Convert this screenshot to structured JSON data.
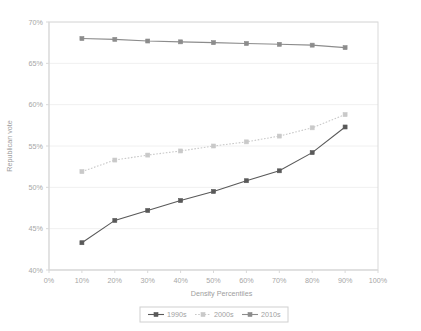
{
  "chart_data": {
    "type": "line",
    "title": "",
    "xlabel": "Density Percentiles",
    "ylabel": "Republican vote",
    "x": [
      10,
      20,
      30,
      40,
      50,
      60,
      70,
      80,
      90
    ],
    "xtick_labels": [
      "0%",
      "10%",
      "20%",
      "30%",
      "40%",
      "50%",
      "60%",
      "70%",
      "80%",
      "90%",
      "100%"
    ],
    "xtick_values": [
      0,
      10,
      20,
      30,
      40,
      50,
      60,
      70,
      80,
      90,
      100
    ],
    "ytick_labels": [
      "40%",
      "45%",
      "50%",
      "55%",
      "60%",
      "65%",
      "70%"
    ],
    "ytick_values": [
      40,
      45,
      50,
      55,
      60,
      65,
      70
    ],
    "xlim": [
      0,
      100
    ],
    "ylim": [
      40,
      70
    ],
    "grid": "horizontal",
    "legend_position": "bottom",
    "series": [
      {
        "name": "1990s",
        "values": [
          43.3,
          46.0,
          47.2,
          48.4,
          49.5,
          50.8,
          52.0,
          54.2,
          57.3
        ],
        "color": "#595959",
        "dash": "none",
        "marker": "square"
      },
      {
        "name": "2000s",
        "values": [
          51.9,
          53.3,
          53.9,
          54.4,
          55.0,
          55.5,
          56.2,
          57.2,
          58.8
        ],
        "color": "#c9c9c9",
        "dash": "dotted",
        "marker": "square"
      },
      {
        "name": "2010s",
        "values": [
          68.0,
          67.9,
          67.7,
          67.6,
          67.5,
          67.4,
          67.3,
          67.2,
          66.9
        ],
        "color": "#8c8c8c",
        "dash": "none",
        "marker": "square"
      }
    ]
  },
  "style": {
    "plot_border_color": "#d9d9d9",
    "grid_color": "#f0f0f0",
    "background": "#ffffff",
    "tick_color": "#a6a6a6"
  }
}
